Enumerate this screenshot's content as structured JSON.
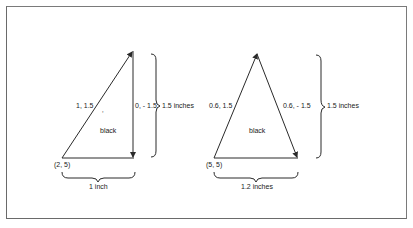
{
  "figure": {
    "left": {
      "origin_label": "(2, 5)",
      "side1_label": "1, 1.5",
      "side2_label": "0, - 1.5",
      "tick_mark": "ʼ",
      "fill_label": "black",
      "height_label": "1.5 inches",
      "width_label": "1 inch"
    },
    "right": {
      "origin_label": "(5, 5)",
      "side1_label": "0.6, 1.5",
      "side2_label": "0.6, - 1.5",
      "fill_label": "black",
      "height_label": "1.5 inches",
      "width_label": "1.2 inches"
    },
    "colors": {
      "line": "#2a2a2a",
      "frame": "#707070",
      "background": "#ffffff"
    }
  }
}
